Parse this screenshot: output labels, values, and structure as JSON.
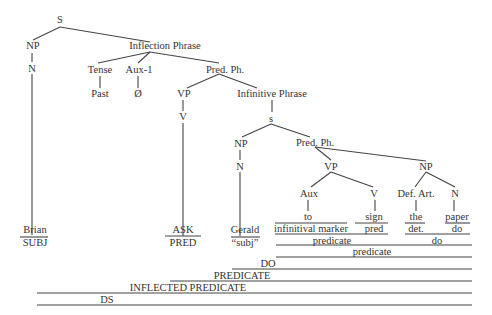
{
  "nodes": {
    "S": "S",
    "NP1": "NP",
    "N1": "N",
    "IP": "Inflection Phrase",
    "Tense": "Tense",
    "Aux1": "Aux-1",
    "Past": "Past",
    "Null": "Ø",
    "PredPh1": "Pred. Ph.",
    "VP1": "VP",
    "V1": "V",
    "InfP": "Infinitive Phrase",
    "s": "s",
    "NP2": "NP",
    "N2": "N",
    "PredPh2": "Pred. Ph.",
    "VP2": "VP",
    "NP3": "NP",
    "Aux": "Aux",
    "V2": "V",
    "DefArt": "Def. Art.",
    "N3": "N"
  },
  "leaves": [
    {
      "word": "Brian",
      "role": "SUBJ"
    },
    {
      "word": "ASK",
      "role": "PRED"
    },
    {
      "word": "Gerald",
      "role": "“subj”"
    },
    {
      "word": "to",
      "role": "infinitival marker"
    },
    {
      "word": "sign",
      "role": "pred"
    },
    {
      "word": "the",
      "role": "det."
    },
    {
      "word": "paper",
      "role": "do"
    }
  ],
  "brackets": {
    "predicate_inner": "predicate",
    "do_inner": "do",
    "predicate_outer": "predicate",
    "DO": "DO",
    "PREDICATE": "PREDICATE",
    "INFLECTED_PREDICATE": "INFLECTED PREDICATE",
    "DS": "DS"
  }
}
